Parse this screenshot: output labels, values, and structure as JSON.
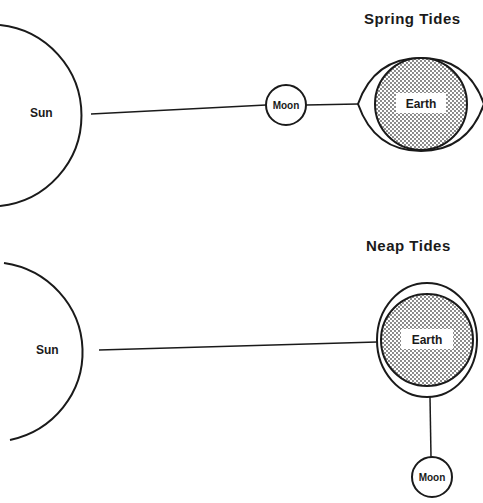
{
  "figure": {
    "panels": [
      {
        "title": "Spring Tides",
        "sun_label": "Sun",
        "moon_label": "Moon",
        "earth_label": "Earth",
        "arrangement": "Sun, Moon and Earth aligned in a straight line; tidal bulge elongated along the Sun-Moon axis"
      },
      {
        "title": "Neap Tides",
        "sun_label": "Sun",
        "moon_label": "Moon",
        "earth_label": "Earth",
        "arrangement": "Moon at right angle to the Sun-Earth line; tidal bulge only slightly elongated"
      }
    ],
    "colors": {
      "line": "#1a1a1a",
      "background": "#ffffff",
      "earth_fill": "stippled grey"
    }
  }
}
